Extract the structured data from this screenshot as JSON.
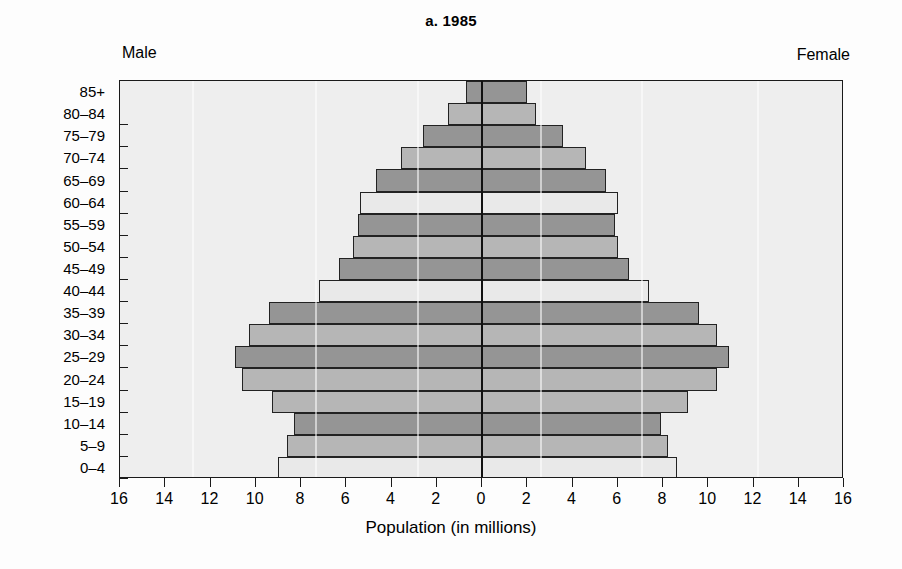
{
  "figure": {
    "title": "a. 1985",
    "male_label": "Male",
    "female_label": "Female",
    "x_axis_title": "Population (in millions)"
  },
  "colors": {
    "plot_background": "#eeeeee",
    "axis": "#1a1a1a",
    "bar_light": "#e9e9e9",
    "bar_mid": "#b6b6b6",
    "bar_dark": "#959595",
    "bar_border": "#222222",
    "page_background": "#fdfdfd"
  },
  "chart_data": {
    "type": "bar",
    "subtype": "population-pyramid",
    "title": "a. 1985",
    "xlabel": "Population (in millions)",
    "ylabel": "",
    "orientation": "horizontal",
    "grid": false,
    "legend_position": "top-corners",
    "xlim": [
      -16,
      16
    ],
    "x_tick_labels": [
      "16",
      "14",
      "12",
      "10",
      "8",
      "6",
      "4",
      "2",
      "0",
      "2",
      "4",
      "6",
      "8",
      "10",
      "12",
      "14",
      "16"
    ],
    "x_tick_values": [
      -16,
      -14,
      -12,
      -10,
      -8,
      -6,
      -4,
      -2,
      0,
      2,
      4,
      6,
      8,
      10,
      12,
      14,
      16
    ],
    "categories": [
      "0–4",
      "5–9",
      "10–14",
      "15–19",
      "20–24",
      "25–29",
      "30–34",
      "35–39",
      "40–44",
      "45–49",
      "50–54",
      "55–59",
      "60–64",
      "65–69",
      "70–74",
      "75–79",
      "80–84",
      "85+"
    ],
    "series": [
      {
        "name": "Male",
        "side": "left",
        "values": [
          9.0,
          8.6,
          8.3,
          9.3,
          10.6,
          10.9,
          10.3,
          9.4,
          7.2,
          6.3,
          5.7,
          5.5,
          5.4,
          4.7,
          3.6,
          2.6,
          1.5,
          0.7
        ]
      },
      {
        "name": "Female",
        "side": "right",
        "values": [
          8.6,
          8.2,
          7.9,
          9.1,
          10.4,
          10.9,
          10.4,
          9.6,
          7.4,
          6.5,
          6.0,
          5.9,
          6.0,
          5.5,
          4.6,
          3.6,
          2.4,
          2.0
        ]
      }
    ],
    "row_shades": [
      "light",
      "mid",
      "dark",
      "mid",
      "mid",
      "dark",
      "mid",
      "dark",
      "light",
      "dark",
      "mid",
      "dark",
      "light",
      "dark",
      "mid",
      "dark",
      "mid",
      "dark"
    ]
  }
}
